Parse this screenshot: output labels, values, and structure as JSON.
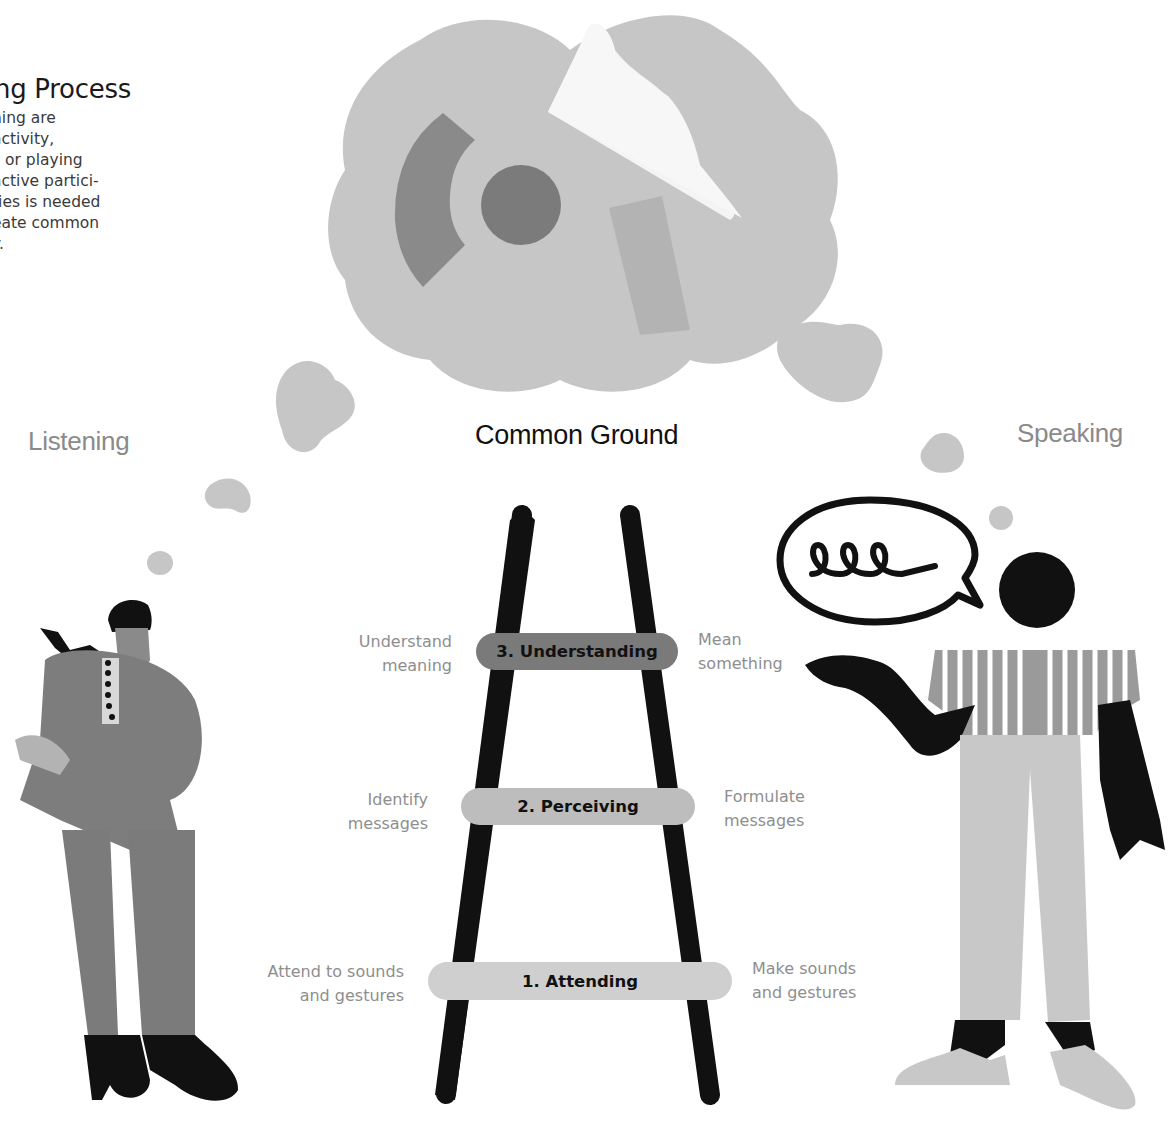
{
  "intro": {
    "title": "ng Process",
    "body": "ning are\nactivity,\nz or playing\nactive partici-\nties is needed\neate common\ny."
  },
  "roles": {
    "listening": "Listening",
    "speaking": "Speaking"
  },
  "center": {
    "title": "Common Ground"
  },
  "ladder": {
    "rungs": [
      {
        "label": "3. Understanding",
        "left_text": "Understand\nmeaning",
        "right_text": "Mean\nsomething",
        "color": "#7a7a7a"
      },
      {
        "label": "2. Perceiving",
        "left_text": "Identify\nmessages",
        "right_text": "Formulate\nmessages",
        "color": "#bdbdbd"
      },
      {
        "label": "1. Attending",
        "left_text": "Attend to sounds\nand gestures",
        "right_text": "Make sounds\nand gestures",
        "color": "#cfcfcf"
      }
    ]
  },
  "colors": {
    "cloud": "#c4c4c4",
    "ink": "#111111",
    "muted_text": "#8e8e8e"
  },
  "icons": {
    "thought_cloud": "thought-cloud-icon",
    "speech_bubble": "speech-bubble-icon",
    "ladder": "ladder-icon"
  }
}
